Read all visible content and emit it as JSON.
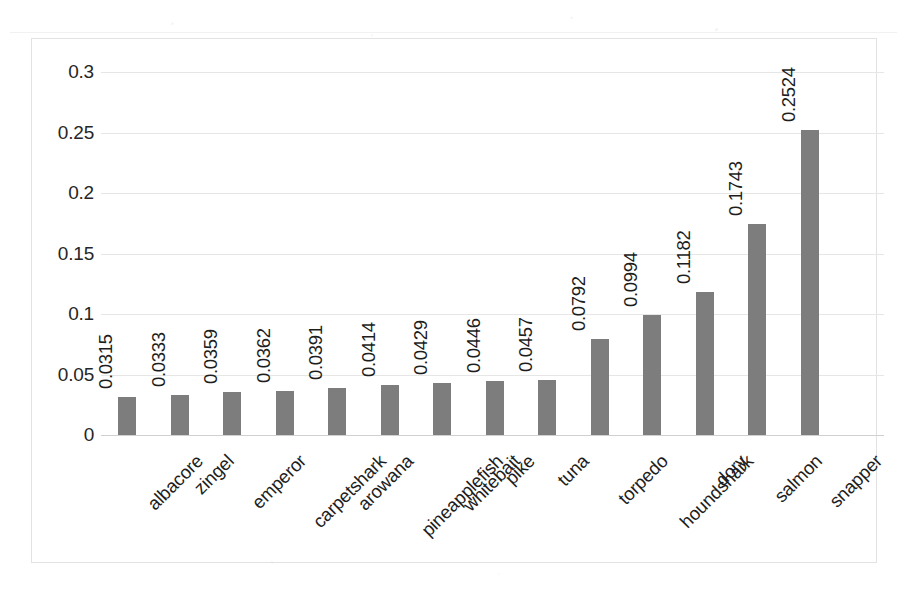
{
  "chart_data": {
    "type": "bar",
    "title": "",
    "subtitle": "",
    "xlabel": "",
    "ylabel": "",
    "legend": [],
    "legend_position": "none",
    "grid": true,
    "orientation": "vertical",
    "bar_color": "#7d7d7d",
    "text_color": "#1d1d1d",
    "gridline_color": "#e6e6e6",
    "border_color": "#e2e2e2",
    "background_color": "#ffffff",
    "ylim": [
      0,
      0.3
    ],
    "yticks": [
      "0",
      "0.05",
      "0.1",
      "0.15",
      "0.2",
      "0.25",
      "0.3"
    ],
    "ytick_values": [
      0,
      0.05,
      0.1,
      0.15,
      0.2,
      0.25,
      0.3
    ],
    "categories": [
      "albacore",
      "zingel",
      "emperor",
      "carpetshark",
      "arowana",
      "pineapplefish",
      "whitebait",
      "pike",
      "tuna",
      "torpedo",
      "houndshark",
      "dory",
      "salmon",
      "snapper"
    ],
    "values": [
      0.0315,
      0.0333,
      0.0359,
      0.0362,
      0.0391,
      0.0414,
      0.0429,
      0.0446,
      0.0457,
      0.0792,
      0.0994,
      0.1182,
      0.1743,
      0.2524
    ],
    "value_labels": [
      "0.0315",
      "0.0333",
      "0.0359",
      "0.0362",
      "0.0391",
      "0.0414",
      "0.0429",
      "0.0446",
      "0.0457",
      "0.0792",
      "0.0994",
      "0.1182",
      "0.1743",
      "0.2524"
    ]
  }
}
